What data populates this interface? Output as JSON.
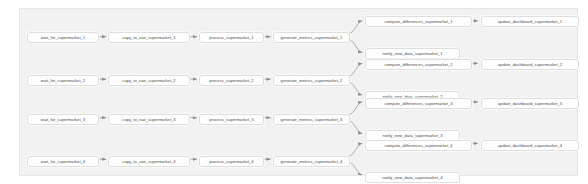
{
  "graph": {
    "type": "dag-graph",
    "title": "supermarket_dag_graph",
    "background_color": "#f2f2f2",
    "node_fill_color": "#fefefe",
    "node_border_color": "#dedede",
    "edge_color": "#9a9a9a",
    "pipelines": [
      {
        "index": 1,
        "wait": "wait_for_supermarket_1",
        "copy": "copy_to_raw_supermarket_1",
        "process": "process_supermarket_1",
        "metrics": "generate_metrics_supermarket_1",
        "compute": "compute_differences_supermarket_1",
        "dashboard": "update_dashboard_supermarket_1",
        "notify": "notify_new_data_supermarket_1"
      },
      {
        "index": 2,
        "wait": "wait_for_supermarket_2",
        "copy": "copy_to_raw_supermarket_2",
        "process": "process_supermarket_2",
        "metrics": "generate_metrics_supermarket_2",
        "compute": "compute_differences_supermarket_2",
        "dashboard": "update_dashboard_supermarket_2",
        "notify": "notify_new_data_supermarket_2"
      },
      {
        "index": 3,
        "wait": "wait_for_supermarket_3",
        "copy": "copy_to_raw_supermarket_3",
        "process": "process_supermarket_3",
        "metrics": "generate_metrics_supermarket_3",
        "compute": "compute_differences_supermarket_3",
        "dashboard": "update_dashboard_supermarket_3",
        "notify": "notify_new_data_supermarket_3"
      },
      {
        "index": 4,
        "wait": "wait_for_supermarket_4",
        "copy": "copy_to_raw_supermarket_4",
        "process": "process_supermarket_4",
        "metrics": "generate_metrics_supermarket_4",
        "compute": "compute_differences_supermarket_4",
        "dashboard": "update_dashboard_supermarket_4",
        "notify": "notify_new_data_supermarket_4"
      }
    ]
  }
}
